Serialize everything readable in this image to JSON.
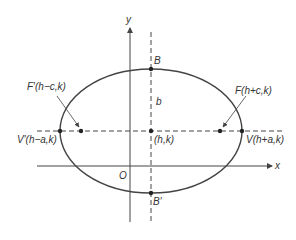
{
  "diagram": {
    "type": "ellipse-with-horizontal-major-axis",
    "colors": {
      "stroke": "#444444",
      "text": "#333333",
      "background": "#ffffff"
    },
    "axes": {
      "x_label": "x",
      "y_label": "y",
      "origin_label": "O"
    },
    "points": {
      "center": "(h,k)",
      "vertex_left": "V′(h−a,k)",
      "vertex_right": "V(h+a,k)",
      "focus_left": "F′(h−c,k)",
      "focus_right": "F(h+c,k)",
      "covertex_top": "B",
      "covertex_bottom": "B′"
    },
    "segment_labels": {
      "semi_minor": "b"
    }
  }
}
